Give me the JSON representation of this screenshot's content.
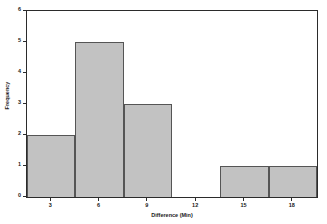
{
  "chart_data": {
    "type": "bar",
    "title": "",
    "xlabel": "Difference (Min)",
    "ylabel": "Frequency",
    "xlim": [
      1.5,
      19.5
    ],
    "ylim": [
      0,
      6
    ],
    "grid": false,
    "legend": null,
    "bin_width": 3,
    "bin_edges": [
      1.5,
      4.5,
      7.5,
      10.5,
      13.5,
      16.5,
      19.5
    ],
    "categories": [
      "1.5-4.5",
      "4.5-7.5",
      "7.5-10.5",
      "10.5-13.5",
      "13.5-16.5",
      "16.5-19.5"
    ],
    "values": [
      2,
      5,
      3,
      0,
      1,
      1
    ],
    "bars": [
      {
        "x0": 1.5,
        "x1": 4.5,
        "value": 2
      },
      {
        "x0": 4.5,
        "x1": 7.5,
        "value": 5
      },
      {
        "x0": 7.5,
        "x1": 10.5,
        "value": 3
      },
      {
        "x0": 13.5,
        "x1": 16.5,
        "value": 1
      },
      {
        "x0": 16.5,
        "x1": 19.5,
        "value": 1
      }
    ],
    "x_ticks": [
      {
        "value": 3,
        "label": "3"
      },
      {
        "value": 6,
        "label": "6"
      },
      {
        "value": 9,
        "label": "9"
      },
      {
        "value": 12,
        "label": "12"
      },
      {
        "value": 15,
        "label": "15"
      },
      {
        "value": 18,
        "label": "18"
      }
    ],
    "y_ticks": [
      {
        "value": 0,
        "label": "0"
      },
      {
        "value": 1,
        "label": "1"
      },
      {
        "value": 2,
        "label": "2"
      },
      {
        "value": 3,
        "label": "3"
      },
      {
        "value": 4,
        "label": "4"
      },
      {
        "value": 5,
        "label": "5"
      },
      {
        "value": 6,
        "label": "6"
      }
    ],
    "colors": {
      "bar_fill": "#c2c2c2",
      "bar_edge": "#555555",
      "axis": "#2b2b2b",
      "background": "#ffffff",
      "text": "#1a1a1a"
    }
  }
}
